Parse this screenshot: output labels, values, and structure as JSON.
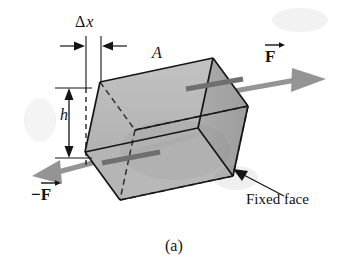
{
  "figure": {
    "caption": "(a)",
    "background_color": "#ffffff",
    "labels": {
      "delta_x_symbol": "Δ",
      "delta_x_variable": "x",
      "height": "h",
      "area": "A",
      "force": "F",
      "force_negative_sign": "−",
      "fixed_face": "Fixed face"
    },
    "colors": {
      "ink": "#121212",
      "outline": "#1a1a1a",
      "face_fill": "#b9b9b9",
      "face_fill_top": "#c6c6c6",
      "face_fill_right": "#a8a8a8",
      "arrow_gray": "#8e8e8e",
      "arrow_gray_dark": "#6f6f6f",
      "dashed_edge": "#2b2b2b"
    },
    "geometry": {
      "front_top_left": [
        100,
        82
      ],
      "front_top_right": [
        213,
        58
      ],
      "front_bottom_left": [
        85,
        152
      ],
      "front_bottom_right": [
        198,
        128
      ],
      "depth_offset": [
        35,
        48
      ],
      "shear_offset_x": 15
    },
    "annotations": [
      {
        "name": "delta-x-dimension",
        "text": "Δx",
        "kind": "dimension"
      },
      {
        "name": "height-dimension",
        "text": "h",
        "kind": "dimension"
      },
      {
        "name": "area-label",
        "text": "A",
        "kind": "label"
      },
      {
        "name": "force-vector-positive",
        "text": "F",
        "kind": "vector"
      },
      {
        "name": "force-vector-negative",
        "text": "−F",
        "kind": "vector"
      },
      {
        "name": "fixed-face-callout",
        "text": "Fixed face",
        "kind": "callout"
      },
      {
        "name": "figure-caption",
        "text": "(a)",
        "kind": "caption"
      }
    ]
  }
}
